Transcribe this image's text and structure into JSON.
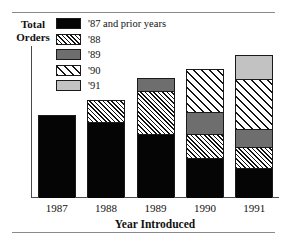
{
  "page": {
    "clipped_caption_above": ""
  },
  "chart_data": {
    "type": "bar",
    "subtype": "stacked-vertical",
    "title": "",
    "xlabel": "Year Introduced",
    "ylabel": "Total Orders",
    "ylabel_lines": [
      "Total",
      "Orders"
    ],
    "categories": [
      "1987",
      "1988",
      "1989",
      "1990",
      "1991"
    ],
    "grid": false,
    "y_axis_ticks": [],
    "ylim": [
      0,
      100
    ],
    "legend_position": "inside-top-left",
    "series": [
      {
        "name": "'87 and prior years",
        "key": "y87",
        "pattern": "solid-black",
        "color": "#050505",
        "values": [
          54,
          50,
          42,
          26,
          19
        ]
      },
      {
        "name": "'88",
        "key": "y88",
        "pattern": "dense-diagonal-hatch",
        "color": "#111111",
        "values": [
          0,
          14,
          28,
          16,
          14
        ]
      },
      {
        "name": "'89",
        "key": "y89",
        "pattern": "solid-dark-gray",
        "color": "#6e6e6e",
        "values": [
          0,
          0,
          9,
          14,
          12
        ]
      },
      {
        "name": "'90",
        "key": "y90",
        "pattern": "sparse-diagonal-hatch",
        "color": "#141414",
        "values": [
          0,
          0,
          0,
          29,
          33
        ]
      },
      {
        "name": "'91",
        "key": "y91",
        "pattern": "solid-light-gray",
        "color": "#c2c2c2",
        "values": [
          0,
          0,
          0,
          0,
          16
        ]
      }
    ],
    "totals": [
      54,
      64,
      79,
      85,
      94
    ]
  }
}
